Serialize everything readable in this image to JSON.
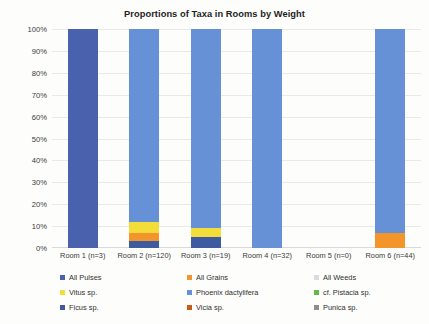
{
  "chart_data": {
    "type": "bar",
    "title": "Proportions of Taxa in Rooms by Weight",
    "xlabel": "",
    "ylabel": "",
    "ylim": [
      0,
      100
    ],
    "stacked": true,
    "normalized_percent": true,
    "grid": true,
    "legend_position": "bottom",
    "categories": [
      "Room 1 (n=3)",
      "Room 2 (n=120)",
      "Room 3 (n=19)",
      "Room 4 (n=32)",
      "Room 5 (n=0)",
      "Room 6 (n=44)"
    ],
    "ytick_labels": [
      "100%",
      "90%",
      "80%",
      "70%",
      "60%",
      "50%",
      "40%",
      "30%",
      "20%",
      "10%",
      "0%"
    ],
    "ytick_values": [
      100,
      90,
      80,
      70,
      60,
      50,
      40,
      30,
      20,
      10,
      0
    ],
    "series": [
      {
        "name": "All Pulses",
        "color": "#4a62ad",
        "values": [
          100,
          0,
          0,
          0,
          0,
          0
        ]
      },
      {
        "name": "All Grains",
        "color": "#f3952a",
        "values": [
          0,
          4,
          0,
          0,
          0,
          7
        ]
      },
      {
        "name": "All Weeds",
        "color": "#d8dbe2",
        "values": [
          0,
          0,
          0,
          0,
          0,
          0
        ]
      },
      {
        "name": "Vitus sp.",
        "color": "#f2dd3a",
        "values": [
          0,
          5,
          4,
          0,
          0,
          0
        ]
      },
      {
        "name": "Phoenix dactylifera",
        "color": "#6791d6",
        "values": [
          0,
          88,
          91,
          100,
          0,
          93
        ]
      },
      {
        "name": "cf. Pistacia sp.",
        "color": "#5fba4a",
        "values": [
          0,
          0,
          0,
          0,
          0,
          0
        ]
      },
      {
        "name": "Ficus sp.",
        "color": "#3d5b9e",
        "values": [
          0,
          3,
          5,
          0,
          0,
          0
        ]
      },
      {
        "name": "Vicia sp.",
        "color": "#c75b18",
        "values": [
          0,
          0,
          0,
          0,
          0,
          0
        ]
      },
      {
        "name": "Punica sp.",
        "color": "#8e8e92",
        "values": [
          0,
          0,
          0,
          0,
          0,
          0
        ]
      }
    ],
    "legend_entries": [
      {
        "label": "All Pulses",
        "color": "#4a62ad"
      },
      {
        "label": "All Grains",
        "color": "#f3952a"
      },
      {
        "label": "All Weeds",
        "color": "#d8dbe2"
      },
      {
        "label": "Vitus sp.",
        "color": "#f2dd3a"
      },
      {
        "label": "Phoenix dactylifera",
        "color": "#6791d6"
      },
      {
        "label": "cf. Pistacia sp.",
        "color": "#5fba4a"
      },
      {
        "label": "Ficus sp.",
        "color": "#3d5b9e"
      },
      {
        "label": "Vicia sp.",
        "color": "#c75b18"
      },
      {
        "label": "Punica sp.",
        "color": "#8e8e92"
      }
    ]
  }
}
